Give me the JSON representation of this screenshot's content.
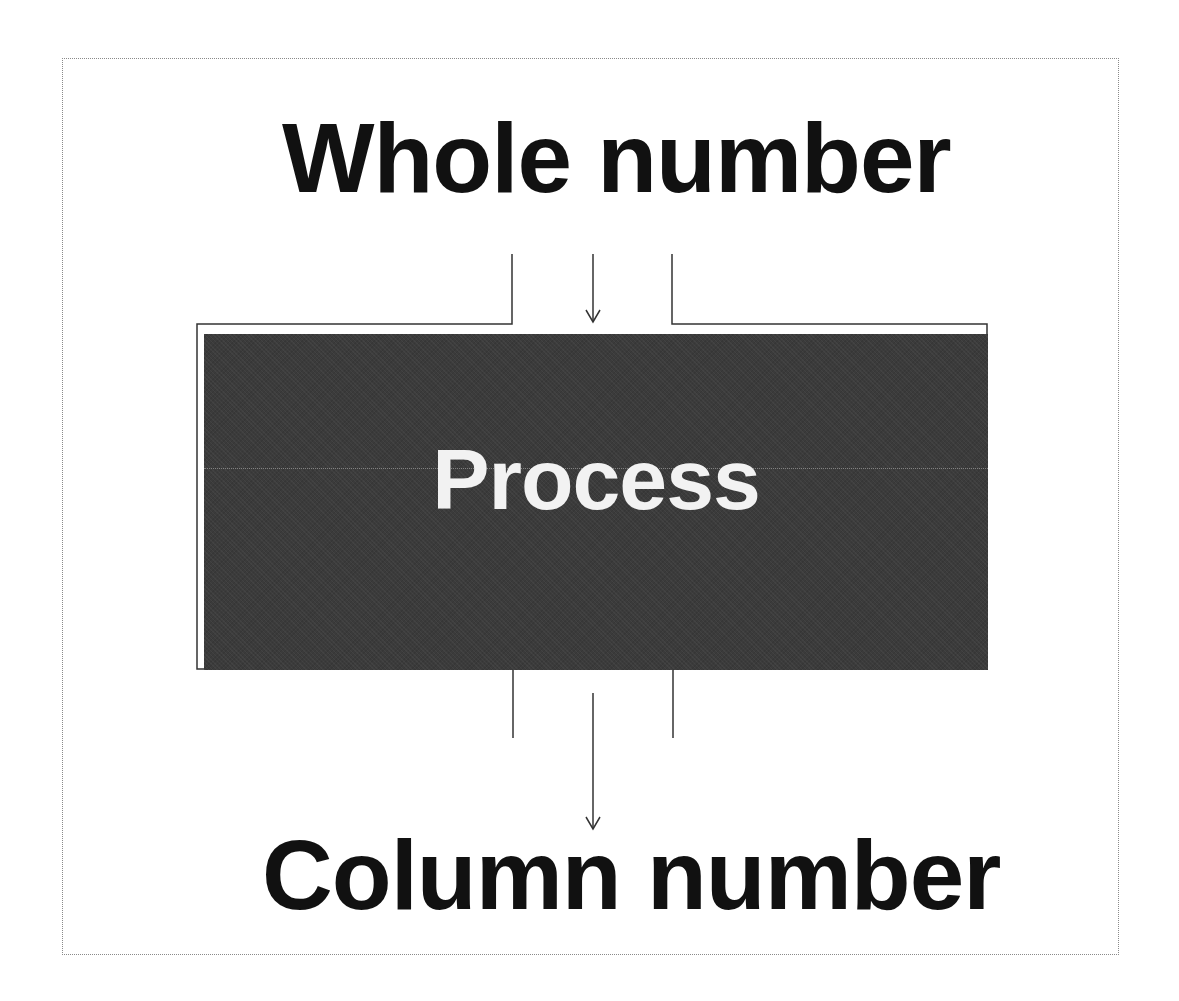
{
  "diagram": {
    "input_label": "Whole number",
    "process_label": "Process",
    "output_label": "Column number",
    "colors": {
      "process_fill": "#3b3b3b",
      "process_text": "#f2f2f2",
      "label_text": "#111111",
      "line": "#333333"
    },
    "flow": [
      "Whole number",
      "Process",
      "Column number"
    ]
  }
}
